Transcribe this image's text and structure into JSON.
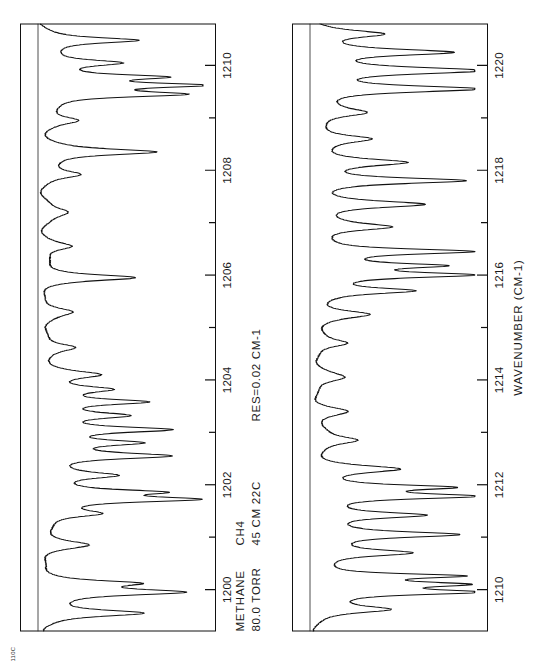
{
  "figure": {
    "corner_code": "110C",
    "orientation_note": "rotated"
  },
  "header": {
    "line1_col1": "METHANE",
    "line1_col2": "CH4",
    "line2_col1": "80.0 TORR",
    "line2_col2": "45 CM 22C",
    "resolution": "RES=0.02  CM-1"
  },
  "axis": {
    "title": "WAVENUMBER (CM-1)"
  },
  "chart_data": [
    {
      "type": "line",
      "title": "METHANE 80.0 TORR CH4 45 CM 22C",
      "xlabel": "WAVENUMBER (CM-1)",
      "ylabel": "",
      "xlim": [
        1199.2,
        1210.8
      ],
      "ylim": [
        0,
        1.06
      ],
      "grid": false,
      "legend": "none",
      "tick_labels": [
        "1200",
        "1202",
        "1204",
        "1206",
        "1208",
        "1210"
      ],
      "tick_values": [
        1200,
        1202,
        1204,
        1206,
        1208,
        1210
      ],
      "minor_tick_values": [
        1201,
        1203,
        1205,
        1207,
        1209
      ],
      "baseline": 1.0,
      "annotations": [
        "baseline at 100% transmission"
      ],
      "lines": [
        {
          "center": 1199.55,
          "depth": 0.62,
          "width": 0.075
        },
        {
          "center": 1199.95,
          "depth": 0.8,
          "width": 0.07
        },
        {
          "center": 1200.12,
          "depth": 0.47,
          "width": 0.06
        },
        {
          "center": 1200.85,
          "depth": 0.26,
          "width": 0.085
        },
        {
          "center": 1201.45,
          "depth": 0.33,
          "width": 0.08
        },
        {
          "center": 1201.72,
          "depth": 0.86,
          "width": 0.062
        },
        {
          "center": 1201.86,
          "depth": 0.58,
          "width": 0.055
        },
        {
          "center": 1202.18,
          "depth": 0.4,
          "width": 0.075
        },
        {
          "center": 1202.55,
          "depth": 0.74,
          "width": 0.07
        },
        {
          "center": 1202.8,
          "depth": 0.52,
          "width": 0.065
        },
        {
          "center": 1203.05,
          "depth": 0.68,
          "width": 0.062
        },
        {
          "center": 1203.32,
          "depth": 0.45,
          "width": 0.07
        },
        {
          "center": 1203.58,
          "depth": 0.6,
          "width": 0.065
        },
        {
          "center": 1203.82,
          "depth": 0.36,
          "width": 0.072
        },
        {
          "center": 1204.1,
          "depth": 0.3,
          "width": 0.08
        },
        {
          "center": 1204.62,
          "depth": 0.22,
          "width": 0.09
        },
        {
          "center": 1205.3,
          "depth": 0.18,
          "width": 0.095
        },
        {
          "center": 1205.95,
          "depth": 0.55,
          "width": 0.068
        },
        {
          "center": 1206.55,
          "depth": 0.2,
          "width": 0.09
        },
        {
          "center": 1207.2,
          "depth": 0.16,
          "width": 0.1
        },
        {
          "center": 1207.92,
          "depth": 0.24,
          "width": 0.085
        },
        {
          "center": 1208.35,
          "depth": 0.68,
          "width": 0.07
        },
        {
          "center": 1208.95,
          "depth": 0.21,
          "width": 0.09
        },
        {
          "center": 1209.45,
          "depth": 0.78,
          "width": 0.062
        },
        {
          "center": 1209.62,
          "depth": 0.84,
          "width": 0.055
        },
        {
          "center": 1209.78,
          "depth": 0.66,
          "width": 0.058
        },
        {
          "center": 1210.05,
          "depth": 0.44,
          "width": 0.07
        },
        {
          "center": 1210.48,
          "depth": 0.58,
          "width": 0.065
        }
      ]
    },
    {
      "type": "line",
      "title": "METHANE 80.0 TORR CH4 45 CM 22C",
      "xlabel": "WAVENUMBER (CM-1)",
      "ylabel": "",
      "xlim": [
        1209.2,
        1220.8
      ],
      "ylim": [
        0,
        1.06
      ],
      "grid": false,
      "legend": "none",
      "tick_labels": [
        "1210",
        "1212",
        "1214",
        "1216",
        "1218",
        "1220"
      ],
      "tick_values": [
        1210,
        1212,
        1214,
        1216,
        1218,
        1220
      ],
      "minor_tick_values": [
        1211,
        1213,
        1215,
        1217,
        1219
      ],
      "baseline": 1.0,
      "annotations": [
        "baseline at 100% transmission"
      ],
      "lines": [
        {
          "center": 1209.62,
          "depth": 0.45,
          "width": 0.08
        },
        {
          "center": 1209.95,
          "depth": 0.88,
          "width": 0.06
        },
        {
          "center": 1210.1,
          "depth": 0.72,
          "width": 0.055
        },
        {
          "center": 1210.26,
          "depth": 0.8,
          "width": 0.052
        },
        {
          "center": 1210.7,
          "depth": 0.56,
          "width": 0.075
        },
        {
          "center": 1211.05,
          "depth": 0.82,
          "width": 0.068
        },
        {
          "center": 1211.42,
          "depth": 0.64,
          "width": 0.07
        },
        {
          "center": 1211.78,
          "depth": 0.9,
          "width": 0.062
        },
        {
          "center": 1211.95,
          "depth": 0.7,
          "width": 0.055
        },
        {
          "center": 1212.3,
          "depth": 0.48,
          "width": 0.08
        },
        {
          "center": 1212.85,
          "depth": 0.26,
          "width": 0.09
        },
        {
          "center": 1213.4,
          "depth": 0.2,
          "width": 0.095
        },
        {
          "center": 1214.05,
          "depth": 0.17,
          "width": 0.1
        },
        {
          "center": 1214.7,
          "depth": 0.22,
          "width": 0.09
        },
        {
          "center": 1215.25,
          "depth": 0.3,
          "width": 0.085
        },
        {
          "center": 1215.7,
          "depth": 0.58,
          "width": 0.07
        },
        {
          "center": 1216.0,
          "depth": 0.86,
          "width": 0.06
        },
        {
          "center": 1216.18,
          "depth": 0.66,
          "width": 0.055
        },
        {
          "center": 1216.45,
          "depth": 0.92,
          "width": 0.062
        },
        {
          "center": 1216.92,
          "depth": 0.44,
          "width": 0.08
        },
        {
          "center": 1217.35,
          "depth": 0.62,
          "width": 0.072
        },
        {
          "center": 1217.8,
          "depth": 0.88,
          "width": 0.065
        },
        {
          "center": 1218.15,
          "depth": 0.5,
          "width": 0.078
        },
        {
          "center": 1218.6,
          "depth": 0.34,
          "width": 0.085
        },
        {
          "center": 1219.1,
          "depth": 0.28,
          "width": 0.09
        },
        {
          "center": 1219.55,
          "depth": 0.94,
          "width": 0.07
        },
        {
          "center": 1219.9,
          "depth": 0.96,
          "width": 0.075
        },
        {
          "center": 1220.25,
          "depth": 0.76,
          "width": 0.068
        },
        {
          "center": 1220.6,
          "depth": 0.4,
          "width": 0.08
        }
      ]
    }
  ]
}
